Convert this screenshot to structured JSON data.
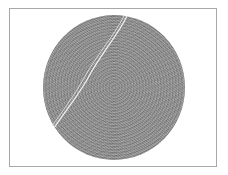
{
  "image": {
    "description": "Grayscale micrograph of a circular specimen with a textured surface and a diagonal crack/fiber line",
    "colors": {
      "background": "#ffffff",
      "frame": "#a8a8a8",
      "disc": "#909090",
      "crack": "#f0f0f0"
    }
  }
}
